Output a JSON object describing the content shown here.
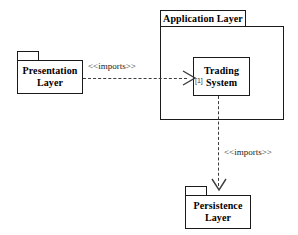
{
  "diagram": {
    "type": "uml-package-diagram",
    "background_color": "#ffffff",
    "line_color": "#1a1a1a",
    "dashed_line_color": "#3c3c3c"
  },
  "packages": {
    "application_layer": {
      "label": "Application Layer"
    },
    "presentation_layer": {
      "label": "Presentation Layer"
    },
    "persistence_layer": {
      "label": "Persistence Layer"
    }
  },
  "elements": {
    "trading_system": {
      "label": "Trading System",
      "multiplicity": "[1]"
    }
  },
  "dependencies": [
    {
      "id": "presentation-to-application",
      "label": "<<imports>>",
      "from": "Presentation Layer",
      "to": "Application Layer",
      "direction": "right",
      "style": "dashed"
    },
    {
      "id": "application-to-persistence",
      "label": "<<imports>>",
      "from": "Trading System",
      "to": "Persistence Layer",
      "direction": "down",
      "style": "dashed"
    }
  ]
}
